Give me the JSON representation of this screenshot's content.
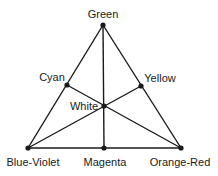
{
  "diagram": {
    "line_color": "#1a1a1a",
    "nodes": [
      {
        "id": "green",
        "label": "Green",
        "x": 103,
        "y": 25,
        "lx": 103,
        "ly": 18,
        "anchor": "middle"
      },
      {
        "id": "cyan",
        "label": "Cyan",
        "x": 67,
        "y": 85,
        "lx": 52,
        "ly": 81,
        "anchor": "middle"
      },
      {
        "id": "yellow",
        "label": "Yellow",
        "x": 141,
        "y": 86,
        "lx": 160,
        "ly": 82,
        "anchor": "middle"
      },
      {
        "id": "white",
        "label": "White",
        "x": 104,
        "y": 106,
        "lx": 84,
        "ly": 110,
        "anchor": "middle"
      },
      {
        "id": "blue-violet",
        "label": "Blue-Violet",
        "x": 28,
        "y": 148,
        "lx": 33,
        "ly": 166,
        "anchor": "middle"
      },
      {
        "id": "magenta",
        "label": "Magenta",
        "x": 104,
        "y": 148,
        "lx": 105,
        "ly": 166,
        "anchor": "middle"
      },
      {
        "id": "orange-red",
        "label": "Orange-Red",
        "x": 181,
        "y": 148,
        "lx": 180,
        "ly": 166,
        "anchor": "middle"
      }
    ],
    "edges": [
      [
        "green",
        "blue-violet"
      ],
      [
        "green",
        "orange-red"
      ],
      [
        "blue-violet",
        "orange-red"
      ],
      [
        "green",
        "magenta"
      ],
      [
        "cyan",
        "orange-red"
      ],
      [
        "yellow",
        "blue-violet"
      ]
    ]
  }
}
